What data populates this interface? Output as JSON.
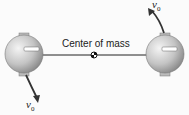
{
  "diagram": {
    "label_center": "Center of mass",
    "velocity_symbol": "v",
    "velocity_subscript": "0",
    "colors": {
      "sphere": "#c8c8c8",
      "rod": "#222222",
      "background": "#fbfbfb"
    }
  }
}
